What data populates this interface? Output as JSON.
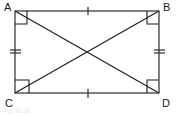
{
  "figure": {
    "type": "rectangle-with-diagonals",
    "vertices": [
      {
        "label": "A",
        "x": 15,
        "y": 11
      },
      {
        "label": "B",
        "x": 159,
        "y": 11
      },
      {
        "label": "C",
        "x": 15,
        "y": 93
      },
      {
        "label": "D",
        "x": 159,
        "y": 93
      }
    ],
    "diagonals": [
      "AD",
      "BC"
    ],
    "right_angles": [
      "A",
      "B",
      "C",
      "D"
    ],
    "equal_marks": {
      "single_tick": [
        "AB",
        "CD"
      ],
      "double_tick": [
        "AC",
        "BD"
      ]
    },
    "stroke_color": "#1a1a1a",
    "caption": "Fig. 10.26"
  },
  "labels": {
    "a": "A",
    "b": "B",
    "c": "C",
    "d": "D"
  }
}
